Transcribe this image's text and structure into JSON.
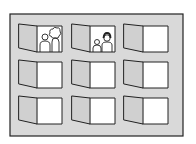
{
  "illustration": {
    "subject": "building facade with windows",
    "colors": {
      "background": "#ffffff",
      "wall": "#d9d9d9",
      "outline": "#222222",
      "window_pane": "#ffffff",
      "shutter": "#d0d0d0"
    },
    "facade": {
      "x": 10,
      "y": 14,
      "width": 173,
      "height": 122
    },
    "grid": {
      "rows": 3,
      "cols": 3
    },
    "columns": [
      {
        "shutter_left": 19,
        "hinge": 37,
        "right": 62
      },
      {
        "shutter_left": 72,
        "hinge": 90,
        "right": 115
      },
      {
        "shutter_left": 124,
        "hinge": 143,
        "right": 168
      }
    ],
    "rows": [
      {
        "top": 26,
        "bottom": 52
      },
      {
        "top": 62,
        "bottom": 88
      },
      {
        "top": 98,
        "bottom": 124
      }
    ],
    "windows": [
      {
        "row": 0,
        "col": 0,
        "occupants": "two-adults"
      },
      {
        "row": 0,
        "col": 1,
        "occupants": "adult-and-child"
      },
      {
        "row": 0,
        "col": 2,
        "occupants": "none"
      },
      {
        "row": 1,
        "col": 0,
        "occupants": "none"
      },
      {
        "row": 1,
        "col": 1,
        "occupants": "none"
      },
      {
        "row": 1,
        "col": 2,
        "occupants": "none"
      },
      {
        "row": 2,
        "col": 0,
        "occupants": "none"
      },
      {
        "row": 2,
        "col": 1,
        "occupants": "none"
      },
      {
        "row": 2,
        "col": 2,
        "occupants": "none"
      }
    ]
  }
}
